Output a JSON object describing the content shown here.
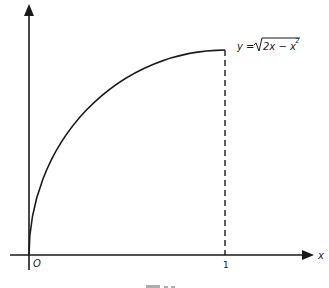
{
  "figure": {
    "axes": {
      "x_label": "x",
      "origin_label": "O",
      "x_tick_label": "1"
    },
    "curve": {
      "equation_lhs": "y = ",
      "equation_radicand": "2x − x",
      "equation_exponent": "2",
      "domain": [
        0,
        1
      ]
    },
    "caption_visible": "partially cut off"
  },
  "colors": {
    "ink": "#1a1a1a",
    "background": "#ffffff"
  }
}
